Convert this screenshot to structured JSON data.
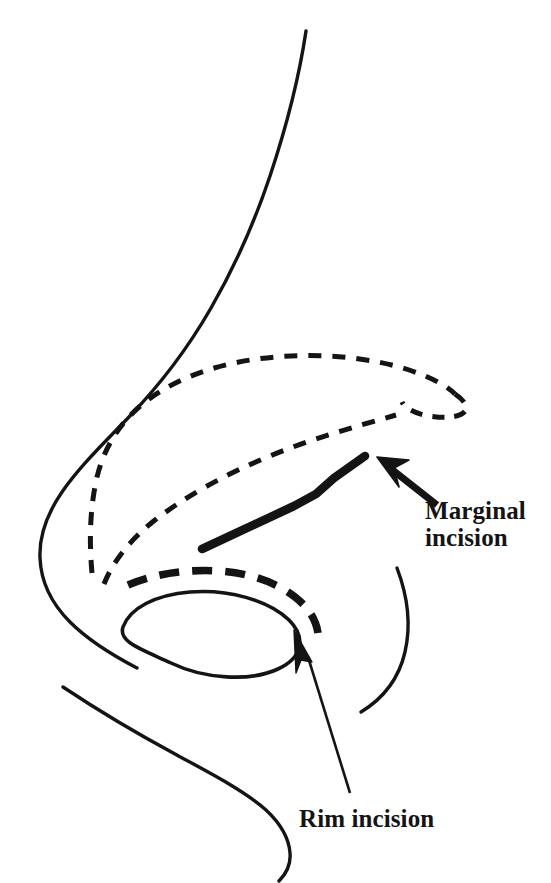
{
  "figure": {
    "background_color": "#ffffff",
    "ink_color": "#141414",
    "width": 551,
    "height": 883
  },
  "labels": {
    "marginal": {
      "line1": "Marginal",
      "line2": "incision",
      "full": "Marginal incision"
    },
    "rim": {
      "line1": "Rim incision",
      "full": "Rim incision"
    }
  },
  "drawing": {
    "nasal_dorsum": "profile outline of nasal dorsum descending from glabella to tip",
    "nasal_tip": "rounded nasal tip and columella contour",
    "upper_lip": "curve of columella base continuing to upper lip",
    "upper_lateral_cartilage": "dashed outline of upper lateral cartilage",
    "lower_lateral_cartilage": "dashed outline of lower lateral cartilage",
    "nostril": "nostril aperture ellipse",
    "alar_crease": "thin crescent arc of alar crease",
    "marginal_incision_line": "bold solid line marking the marginal incision",
    "rim_incision_line": "bold dashed line marking the rim incision along the nostril rim",
    "marginal_arrow": "solid arrow pointing to the marginal incision",
    "rim_arrow": "thin arrow pointing to the rim incision"
  }
}
